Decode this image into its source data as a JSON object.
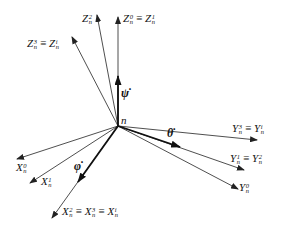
{
  "diagram": {
    "origin_label": "n",
    "line_color": "#222222",
    "axes": {
      "z_group": [
        {
          "id": "Z0_Z1",
          "label_parts": [
            {
              "base": "Z",
              "sup": "0",
              "sub": "n"
            },
            {
              "base": "Z",
              "sup": "1",
              "sub": "n"
            }
          ],
          "end": [
            118,
            17
          ]
        },
        {
          "id": "Z2",
          "label_parts": [
            {
              "base": "Z",
              "sup": "2",
              "sub": "n"
            }
          ],
          "end": [
            97,
            15
          ]
        },
        {
          "id": "Z3_Zi",
          "label_parts": [
            {
              "base": "Z",
              "sup": "3",
              "sub": "n"
            },
            {
              "base": "Z",
              "sup": "i",
              "sub": "n"
            }
          ],
          "end": [
            72,
            37
          ]
        }
      ],
      "y_group": [
        {
          "id": "Y3_Yi",
          "label_parts": [
            {
              "base": "Y",
              "sup": "3",
              "sub": "n"
            },
            {
              "base": "Y",
              "sup": "i",
              "sub": "n"
            }
          ],
          "end": [
            257,
            140
          ]
        },
        {
          "id": "Y1_Y2",
          "label_parts": [
            {
              "base": "Y",
              "sup": "1",
              "sub": "n"
            },
            {
              "base": "Y",
              "sup": "2",
              "sub": "n"
            }
          ],
          "end": [
            244,
            170
          ]
        },
        {
          "id": "Y0",
          "label_parts": [
            {
              "base": "Y",
              "sup": "0",
              "sub": "n"
            }
          ],
          "end": [
            238,
            189
          ]
        }
      ],
      "x_group": [
        {
          "id": "X0",
          "label_parts": [
            {
              "base": "X",
              "sup": "0",
              "sub": "n"
            }
          ],
          "end": [
            17,
            159
          ]
        },
        {
          "id": "X1",
          "label_parts": [
            {
              "base": "X",
              "sup": "1",
              "sub": "n"
            }
          ],
          "end": [
            30,
            183
          ]
        },
        {
          "id": "X2_X3_Xi",
          "label_parts": [
            {
              "base": "X",
              "sup": "2",
              "sub": "n"
            },
            {
              "base": "X",
              "sup": "3",
              "sub": "n"
            },
            {
              "base": "X",
              "sup": "i",
              "sub": "n"
            }
          ],
          "end": [
            52,
            218
          ]
        }
      ]
    },
    "rates": [
      {
        "id": "psi_dot",
        "symbol": "ψ̇",
        "end": [
          118,
          76
        ]
      },
      {
        "id": "theta_dot",
        "symbol": "θ̇",
        "end": [
          180,
          147
        ]
      },
      {
        "id": "phi_dot",
        "symbol": "φ̇",
        "end": [
          78,
          182
        ]
      }
    ],
    "equiv_symbol": "≡",
    "labels": {
      "z0": {
        "base": "Z",
        "sup": "0",
        "sub": "n"
      },
      "z1": {
        "base": "Z",
        "sup": "1",
        "sub": "n"
      },
      "z2": {
        "base": "Z",
        "sup": "2",
        "sub": "n"
      },
      "z3": {
        "base": "Z",
        "sup": "3",
        "sub": "n"
      },
      "zi": {
        "base": "Z",
        "sup": "i",
        "sub": "n"
      },
      "y3": {
        "base": "Y",
        "sup": "3",
        "sub": "n"
      },
      "yi": {
        "base": "Y",
        "sup": "i",
        "sub": "n"
      },
      "y1": {
        "base": "Y",
        "sup": "1",
        "sub": "n"
      },
      "y2": {
        "base": "Y",
        "sup": "2",
        "sub": "n"
      },
      "y0": {
        "base": "Y",
        "sup": "0",
        "sub": "n"
      },
      "x0": {
        "base": "X",
        "sup": "0",
        "sub": "n"
      },
      "x1": {
        "base": "X",
        "sup": "1",
        "sub": "n"
      },
      "x2": {
        "base": "X",
        "sup": "2",
        "sub": "n"
      },
      "x3": {
        "base": "X",
        "sup": "3",
        "sub": "n"
      },
      "xi": {
        "base": "X",
        "sup": "i",
        "sub": "n"
      },
      "psi_dot": "ψ̇",
      "theta_dot": "θ̇",
      "phi_dot": "φ̇",
      "n": "n"
    }
  }
}
